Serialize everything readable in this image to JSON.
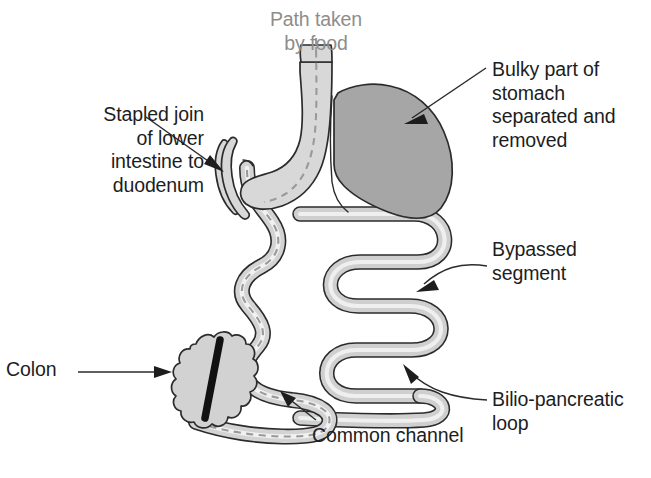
{
  "diagram": {
    "labels": {
      "stapled_join": "Stapled join\nof lower\nintestine to\nduodenum",
      "path_taken_by_food": "Path taken\nby food",
      "bulky_part": "Bulky part of\nstomach\nseparated and\nremoved",
      "bypassed_segment": "Bypassed\nsegment",
      "bilio_pancreatic_loop": "Bilio-pancreatic\nloop",
      "colon": "Colon",
      "common_channel": "Common channel"
    },
    "colors": {
      "background": "#ffffff",
      "text": "#1d1d1d",
      "text_muted": "#8d8d8d",
      "outline": "#2b2b2b",
      "organ_light_fill": "#d8d8d8",
      "organ_mid_fill": "#c4c4c4",
      "stomach_removed_fill": "#a6a6a6",
      "food_path_dash": "#9a9a9a",
      "colon_fill": "#d2d2d2",
      "colon_stripe": "#111111"
    },
    "parts": [
      {
        "name": "esophagus",
        "fill": "organ_light_fill"
      },
      {
        "name": "gastric-sleeve",
        "fill": "organ_light_fill"
      },
      {
        "name": "removed-stomach",
        "fill": "stomach_removed_fill"
      },
      {
        "name": "duodenal-stump",
        "fill": "organ_light_fill"
      },
      {
        "name": "alimentary-limb",
        "fill": "organ_mid_fill"
      },
      {
        "name": "bypassed-loop",
        "fill": "organ_mid_fill"
      },
      {
        "name": "common-channel",
        "fill": "organ_mid_fill"
      },
      {
        "name": "colon",
        "fill": "colon_fill"
      },
      {
        "name": "food-path-dashed-line",
        "fill": "food_path_dash"
      }
    ]
  }
}
